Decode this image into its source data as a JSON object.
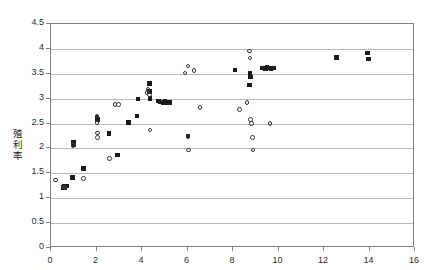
{
  "chart_data": {
    "type": "scatter",
    "title": "",
    "xlabel": "",
    "ylabel": "殖利率",
    "xlim": [
      0,
      16
    ],
    "ylim": [
      0,
      4.5
    ],
    "xticks": [
      0,
      2,
      4,
      6,
      8,
      10,
      12,
      14,
      16
    ],
    "yticks": [
      0,
      0.5,
      1,
      1.5,
      2,
      2.5,
      3,
      3.5,
      4,
      4.5
    ],
    "grid": "horizontal",
    "legend": "none",
    "series": [
      {
        "name": "filled-square",
        "marker": "filled-square",
        "color": "#1a1a1a",
        "points": [
          [
            0.55,
            1.22
          ],
          [
            0.6,
            1.24
          ],
          [
            0.62,
            1.21
          ],
          [
            0.68,
            1.25
          ],
          [
            0.95,
            1.42
          ],
          [
            0.98,
            2.12
          ],
          [
            0.99,
            2.08
          ],
          [
            1.42,
            1.6
          ],
          [
            2.02,
            2.62
          ],
          [
            2.05,
            2.58
          ],
          [
            2.55,
            2.3
          ],
          [
            2.92,
            1.87
          ],
          [
            3.4,
            2.52
          ],
          [
            3.78,
            2.65
          ],
          [
            3.82,
            2.99
          ],
          [
            4.32,
            3.3
          ],
          [
            4.33,
            3.14
          ],
          [
            4.35,
            2.99
          ],
          [
            4.36,
            3.0
          ],
          [
            4.72,
            2.95
          ],
          [
            4.8,
            2.93
          ],
          [
            4.92,
            2.92
          ],
          [
            5.02,
            2.95
          ],
          [
            5.12,
            2.92
          ],
          [
            5.22,
            2.92
          ],
          [
            6.02,
            2.25
          ],
          [
            8.08,
            3.58
          ],
          [
            8.72,
            3.27
          ],
          [
            8.74,
            3.52
          ],
          [
            8.78,
            3.44
          ],
          [
            9.3,
            3.62
          ],
          [
            9.42,
            3.6
          ],
          [
            9.5,
            3.63
          ],
          [
            9.62,
            3.62
          ],
          [
            9.68,
            3.6
          ],
          [
            9.78,
            3.62
          ],
          [
            12.55,
            3.83
          ],
          [
            13.92,
            3.92
          ],
          [
            13.95,
            3.8
          ]
        ]
      },
      {
        "name": "open-circle",
        "marker": "open-circle",
        "color": "#3a3a3a",
        "points": [
          [
            0.2,
            1.37
          ],
          [
            0.55,
            1.23
          ],
          [
            0.62,
            1.22
          ],
          [
            0.96,
            2.06
          ],
          [
            1.42,
            1.4
          ],
          [
            2.02,
            2.65
          ],
          [
            2.03,
            2.52
          ],
          [
            2.04,
            2.31
          ],
          [
            2.05,
            2.22
          ],
          [
            2.58,
            1.8
          ],
          [
            2.82,
            2.88
          ],
          [
            2.96,
            2.88
          ],
          [
            4.22,
            3.12
          ],
          [
            4.26,
            3.18
          ],
          [
            4.32,
            3.08
          ],
          [
            4.35,
            2.37
          ],
          [
            5.88,
            3.52
          ],
          [
            6.02,
            3.66
          ],
          [
            6.28,
            3.57
          ],
          [
            6.02,
            2.24
          ],
          [
            6.05,
            1.97
          ],
          [
            6.55,
            2.82
          ],
          [
            8.28,
            2.78
          ],
          [
            8.62,
            2.92
          ],
          [
            8.72,
            3.96
          ],
          [
            8.74,
            3.82
          ],
          [
            8.78,
            2.58
          ],
          [
            8.82,
            2.5
          ],
          [
            8.85,
            2.22
          ],
          [
            8.88,
            1.97
          ],
          [
            9.62,
            2.5
          ]
        ]
      }
    ]
  },
  "axis": {
    "y_title_chars": [
      "殖",
      "利",
      "率"
    ],
    "y_labels": [
      "4.5",
      "4",
      "3.5",
      "3",
      "2.5",
      "2",
      "1.5",
      "1",
      "0.5",
      "0"
    ],
    "x_labels": [
      "0",
      "2",
      "4",
      "6",
      "8",
      "10",
      "12",
      "14",
      "16"
    ]
  }
}
